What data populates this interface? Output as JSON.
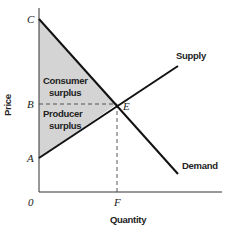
{
  "diagram": {
    "axes": {
      "x_label": "Quantity",
      "y_label": "Price",
      "origin_label": "0"
    },
    "points": {
      "C": "C",
      "B": "B",
      "A": "A",
      "E": "E",
      "F": "F"
    },
    "curves": {
      "supply": "Supply",
      "demand": "Demand"
    },
    "regions": {
      "consumer_surplus": [
        "Consumer",
        "surplus"
      ],
      "producer_surplus": [
        "Producer",
        "surplus"
      ]
    },
    "colors": {
      "fill": "#d4d4d4",
      "line": "#111111",
      "axis": "#333333",
      "dashed": "#444444"
    }
  }
}
